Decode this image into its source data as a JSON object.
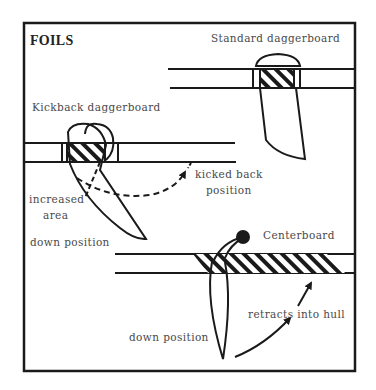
{
  "diagram": {
    "title": "FOILS",
    "labels": {
      "standard": "Standard daggerboard",
      "kickback": "Kickback daggerboard",
      "kicked_back_1": "kicked back",
      "kicked_back_2": "position",
      "increased_1": "increased",
      "increased_2": "area",
      "kick_down": "down position",
      "centerboard": "Centerboard",
      "retracts": "retracts into hull",
      "cb_down": "down position"
    },
    "colors": {
      "ink": "#1a1a1a",
      "text": "#4a4a4a",
      "background": "#ffffff"
    }
  }
}
